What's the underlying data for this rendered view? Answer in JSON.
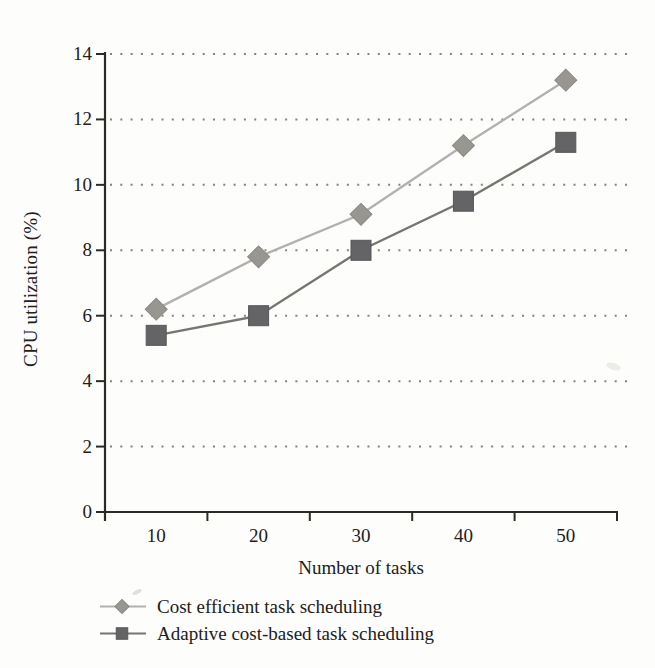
{
  "chart_data": {
    "type": "line",
    "title": "",
    "xlabel": "Number of tasks",
    "ylabel": "CPU utilization (%)",
    "categories": [
      "10",
      "20",
      "30",
      "40",
      "50"
    ],
    "series": [
      {
        "name": "Cost efficient task scheduling",
        "marker": "diamond",
        "values": [
          6.2,
          7.8,
          9.1,
          11.2,
          13.2
        ],
        "line_color": "#b3b1ad",
        "marker_color": "#989691",
        "marker_edge": "#8a8883"
      },
      {
        "name": "Adaptive cost-based task scheduling",
        "marker": "square",
        "values": [
          5.4,
          6.0,
          8.0,
          9.5,
          11.3
        ],
        "line_color": "#77756f",
        "marker_color": "#646466",
        "marker_edge": "#57575a"
      }
    ],
    "ylim": [
      0,
      14
    ],
    "yticks": [
      0,
      2,
      4,
      6,
      8,
      10,
      12,
      14
    ],
    "grid": "dotted-horizontal",
    "grid_color": "#57554f",
    "axis_color": "#2b2a26",
    "text_color": "#21201c",
    "background": "#fdfdfb",
    "legend_position": "bottom-left"
  }
}
